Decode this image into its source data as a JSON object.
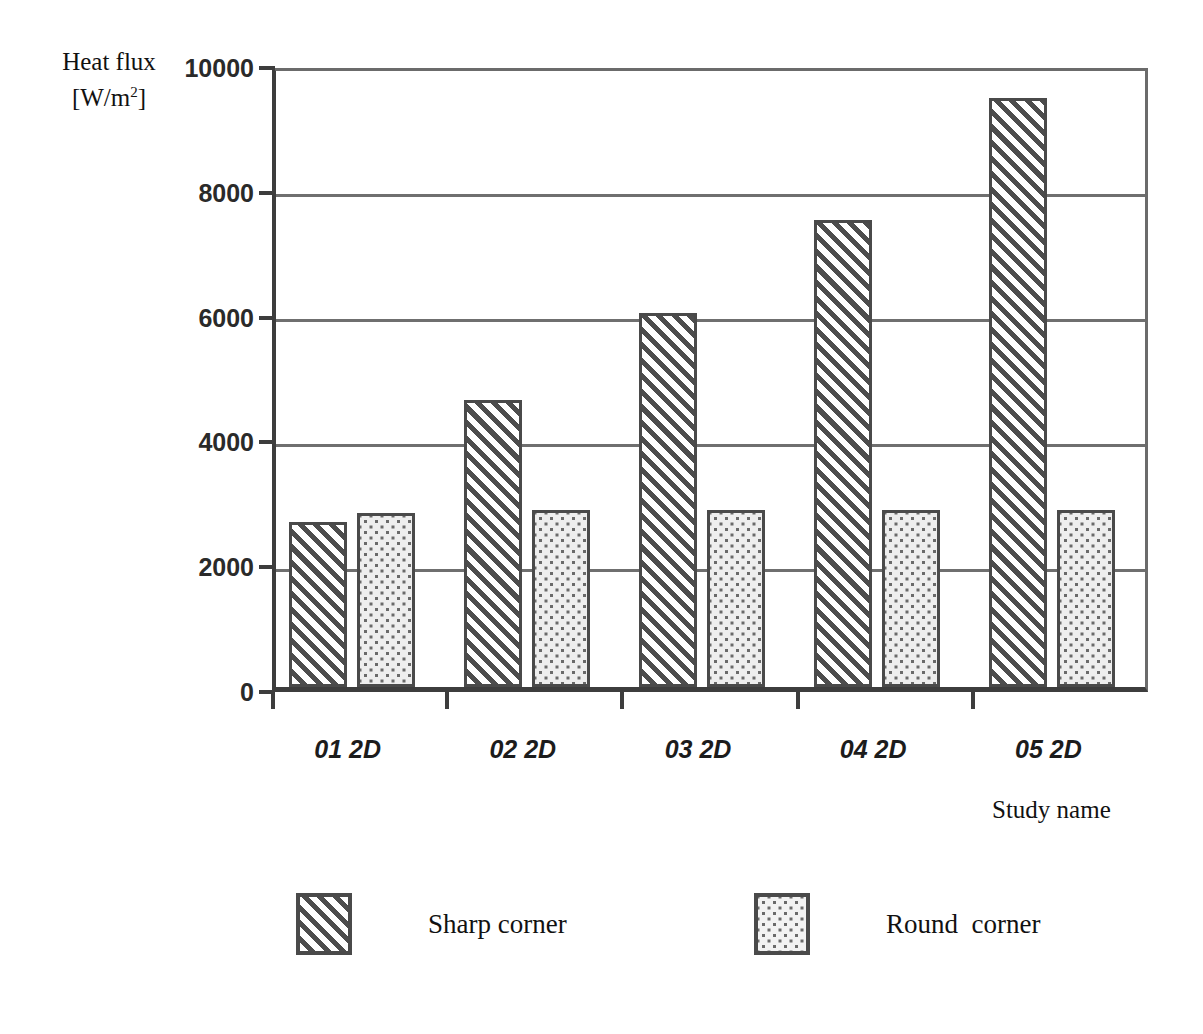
{
  "chart_data": {
    "type": "bar",
    "title": "",
    "categories": [
      "01 2D",
      "02 2D",
      "03 2D",
      "04 2D",
      "05 2D"
    ],
    "series": [
      {
        "name": "Sharp corner",
        "values": [
          2650,
          4600,
          6000,
          7480,
          9440
        ],
        "pattern": "diagonal-hatch"
      },
      {
        "name": "Round  corner",
        "values": [
          2790,
          2840,
          2840,
          2840,
          2840
        ],
        "pattern": "dotted"
      }
    ],
    "ylabel_line1": "Heat flux",
    "ylabel_line2": "[W/m",
    "ylabel_exponent": "2",
    "ylabel_line2_end": "]",
    "xlabel": "Study name",
    "ylim": [
      0,
      10000
    ],
    "yticks": [
      "0",
      "2000",
      "4000",
      "6000",
      "8000",
      "10000"
    ],
    "ytick_values": [
      0,
      2000,
      4000,
      6000,
      8000,
      10000
    ],
    "grid": "horizontal",
    "legend_position": "bottom"
  },
  "legend": {
    "entries": [
      {
        "label": "Sharp corner",
        "pattern": "diagonal-hatch"
      },
      {
        "label": "Round  corner",
        "pattern": "dotted"
      }
    ]
  },
  "colors": {
    "axis": "#3d3d3d",
    "gridline": "#6f6f6f",
    "bar_outline": "#4a4a4a",
    "hatch": "#4d4d4d",
    "dots": "#6a6a6a",
    "background": "#ffffff"
  }
}
